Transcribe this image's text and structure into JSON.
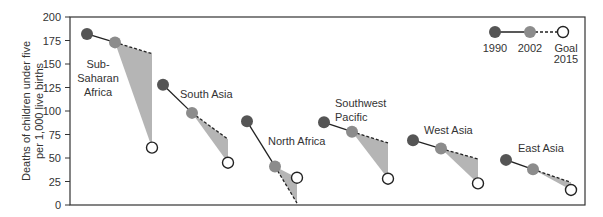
{
  "chart_data": {
    "type": "line",
    "title": "",
    "xlabel": "",
    "ylabel": "Deaths of children under five per 1,000 live births",
    "ylabel_lines": [
      "Deaths of children under five",
      "per 1,000 live births"
    ],
    "ylim": [
      0,
      200
    ],
    "yticks": [
      0,
      25,
      50,
      75,
      100,
      125,
      150,
      175,
      200
    ],
    "grid": false,
    "legend": {
      "position": "top-right",
      "entries": [
        {
          "label": "1990",
          "marker": "dark-filled-circle"
        },
        {
          "label": "2002",
          "marker": "gray-filled-circle"
        },
        {
          "label": "Goal 2015",
          "label_lines": [
            "Goal",
            "2015"
          ],
          "marker": "open-circle"
        }
      ]
    },
    "categories": [
      "Sub-Saharan Africa",
      "South Asia",
      "North Africa",
      "Southwest Pacific",
      "West Asia",
      "East Asia"
    ],
    "series": [
      {
        "name": "1990",
        "values": [
          182,
          128,
          89,
          88,
          69,
          48
        ]
      },
      {
        "name": "2002",
        "values": [
          173,
          98,
          41,
          78,
          60,
          38
        ]
      },
      {
        "name": "Goal 2015",
        "values": [
          61,
          45,
          29,
          28,
          23,
          16
        ]
      },
      {
        "name": "2015 projected at current trend",
        "values": [
          161,
          70,
          2,
          66,
          49,
          24
        ]
      }
    ],
    "annotations": [
      "Sub-Saharan Africa",
      "South Asia",
      "North Africa",
      "Southwest Pacific",
      "West Asia",
      "East Asia"
    ]
  },
  "colors": {
    "y1990": "#555555",
    "y2002": "#8c8c8c",
    "goal_fill": "#ffffff",
    "gap_shade": "#b5b5b5",
    "axis": "#333333"
  }
}
